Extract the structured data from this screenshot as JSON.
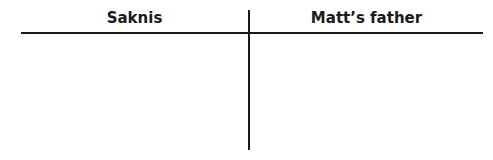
{
  "t_chart": {
    "columns": [
      {
        "header": "Saknis"
      },
      {
        "header": "Matt’s father"
      }
    ]
  }
}
